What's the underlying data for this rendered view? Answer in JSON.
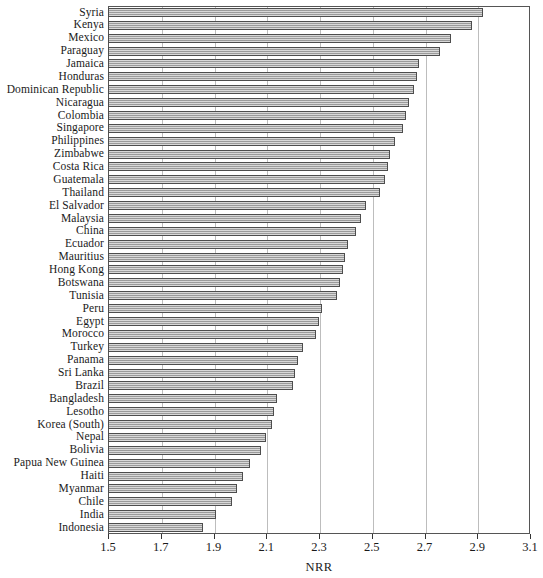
{
  "chart_data": {
    "type": "bar",
    "orientation": "horizontal",
    "title": "",
    "subtitle": "",
    "xlabel": "NRR",
    "ylabel": "",
    "xlim": [
      1.5,
      3.1
    ],
    "xticks": [
      1.5,
      1.7,
      1.9,
      2.1,
      2.3,
      2.5,
      2.7,
      2.9,
      3.1
    ],
    "xtick_labels": [
      "1.5",
      "1.7",
      "1.9",
      "2.1",
      "2.3",
      "2.5",
      "2.7",
      "2.9",
      "3.1"
    ],
    "grid": "vertical",
    "legend": null,
    "bar_fill_color": "#a9a9a9",
    "bar_edge_color": "#4d4d4d",
    "frame_color": "#555555",
    "gridline_color": "#bdbdbd",
    "categories": [
      "Syria",
      "Kenya",
      "Mexico",
      "Paraguay",
      "Jamaica",
      "Honduras",
      "Dominican Republic",
      "Nicaragua",
      "Colombia",
      "Singapore",
      "Philippines",
      "Zimbabwe",
      "Costa Rica",
      "Guatemala",
      "Thailand",
      "El Salvador",
      "Malaysia",
      "China",
      "Ecuador",
      "Mauritius",
      "Hong Kong",
      "Botswana",
      "Tunisia",
      "Peru",
      "Egypt",
      "Morocco",
      "Turkey",
      "Panama",
      "Sri Lanka",
      "Brazil",
      "Bangladesh",
      "Lesotho",
      "Korea (South)",
      "Nepal",
      "Bolivia",
      "Papua New Guinea",
      "Haiti",
      "Myanmar",
      "Chile",
      "India",
      "Indonesia"
    ],
    "values": [
      2.92,
      2.88,
      2.8,
      2.76,
      2.68,
      2.67,
      2.66,
      2.64,
      2.63,
      2.62,
      2.59,
      2.57,
      2.56,
      2.55,
      2.53,
      2.48,
      2.46,
      2.44,
      2.41,
      2.4,
      2.39,
      2.38,
      2.37,
      2.31,
      2.3,
      2.29,
      2.24,
      2.22,
      2.21,
      2.2,
      2.14,
      2.13,
      2.12,
      2.1,
      2.08,
      2.04,
      2.01,
      1.99,
      1.97,
      1.91,
      1.86
    ]
  }
}
